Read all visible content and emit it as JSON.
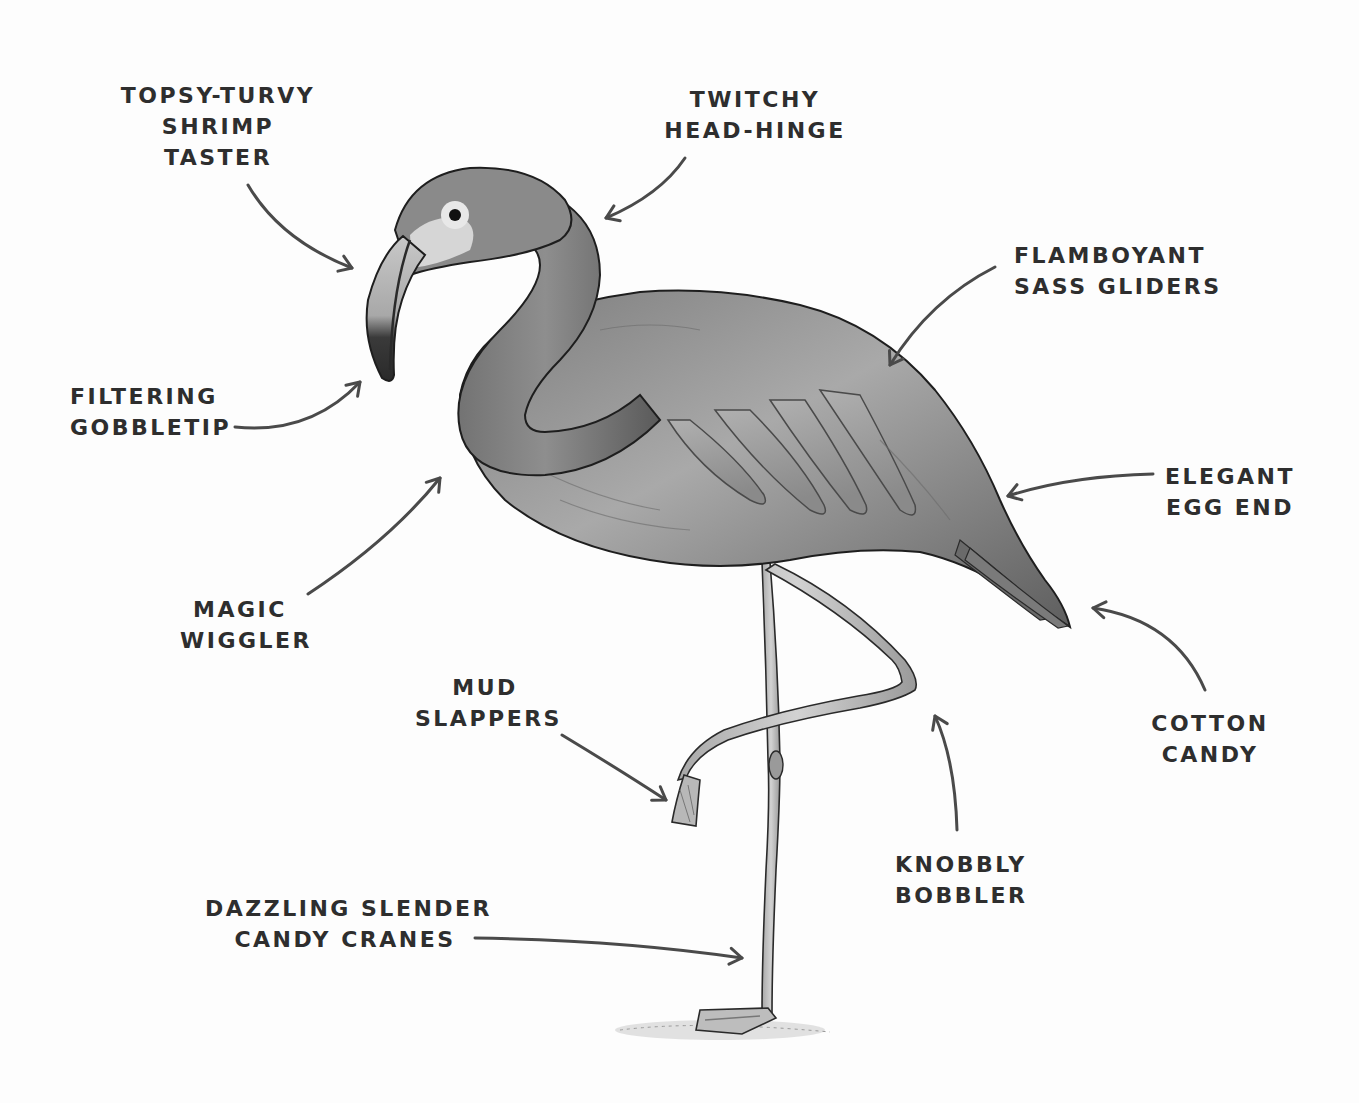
{
  "diagram": {
    "style": "grayscale pencil illustration with hand-lettered labels and curved arrows",
    "colors": {
      "background": "#fdfdfd",
      "text": "#2e2e2e",
      "arrow": "#4a4a4a",
      "body_mid": "#8c8c8c",
      "body_dark": "#4f4f4f",
      "body_light": "#c4c4c4",
      "outline": "#1e1e1e"
    },
    "labels": [
      {
        "id": "shrimp-taster",
        "lines": [
          "TOPSY-TURVY",
          "SHRIMP",
          "TASTER"
        ],
        "points_to": "head"
      },
      {
        "id": "head-hinge",
        "lines": [
          "TWITCHY",
          "HEAD-HINGE"
        ],
        "points_to": "back of neck"
      },
      {
        "id": "sass-gliders",
        "lines": [
          "FLAMBOYANT",
          "SASS GLIDERS"
        ],
        "points_to": "wings"
      },
      {
        "id": "gobbletip",
        "lines": [
          "FILTERING",
          "GOBBLETIP"
        ],
        "points_to": "beak tip"
      },
      {
        "id": "egg-end",
        "lines": [
          "ELEGANT",
          "EGG END"
        ],
        "points_to": "rear body"
      },
      {
        "id": "magic-wiggler",
        "lines": [
          "MAGIC",
          "WIGGLER"
        ],
        "points_to": "neck"
      },
      {
        "id": "cotton-candy",
        "lines": [
          "COTTON",
          "CANDY"
        ],
        "points_to": "tail feathers"
      },
      {
        "id": "mud-slappers",
        "lines": [
          "MUD",
          "SLAPPERS"
        ],
        "points_to": "raised foot"
      },
      {
        "id": "knobbly-bobbler",
        "lines": [
          "KNOBBLY",
          "BOBBLER"
        ],
        "points_to": "bent knee"
      },
      {
        "id": "candy-cranes",
        "lines": [
          "DAZZLING SLENDER",
          "CANDY CRANES"
        ],
        "points_to": "standing leg"
      }
    ]
  }
}
